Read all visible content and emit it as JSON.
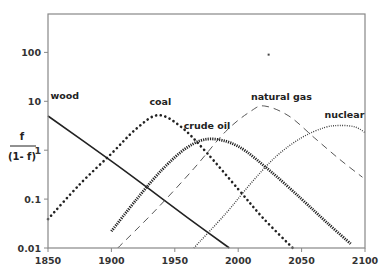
{
  "chart_data": {
    "type": "line",
    "title": "",
    "xlabel": "",
    "ylabel": "f / (1-f)",
    "ylabel_numerator": "f",
    "ylabel_denominator": "(1- f)",
    "yscale": "log",
    "xlim": [
      1850,
      2100
    ],
    "ylim": [
      0.01,
      600
    ],
    "grid": false,
    "legend": "inline labels",
    "x_ticks": [
      1850,
      1900,
      1950,
      2000,
      2050,
      2100
    ],
    "x_tick_labels": [
      "1850",
      "1900",
      "1950",
      "2000",
      "2050",
      "2100"
    ],
    "y_ticks": [
      0.01,
      0.1,
      1,
      10,
      100
    ],
    "y_tick_labels": [
      "0.01",
      "0.1",
      "1",
      "10",
      "100"
    ],
    "series": [
      {
        "name": "wood",
        "style": "solid",
        "label_pos": [
          1852,
          11
        ],
        "points": [
          [
            1850,
            5.0
          ],
          [
            1900,
            0.6
          ],
          [
            1930,
            0.16
          ],
          [
            1960,
            0.042
          ],
          [
            1993,
            0.01
          ]
        ]
      },
      {
        "name": "coal",
        "style": "dotted-large",
        "label_pos": [
          1930,
          8.5
        ],
        "points": [
          [
            1850,
            0.039
          ],
          [
            1875,
            0.2
          ],
          [
            1900,
            0.85
          ],
          [
            1920,
            2.8
          ],
          [
            1937,
            5.2
          ],
          [
            1955,
            3.0
          ],
          [
            1975,
            0.9
          ],
          [
            2000,
            0.16
          ],
          [
            2020,
            0.04
          ],
          [
            2043,
            0.01
          ]
        ]
      },
      {
        "name": "crude oil",
        "style": "dotted-dense",
        "label_pos": [
          1957,
          2.7
        ],
        "points": [
          [
            1900,
            0.022
          ],
          [
            1920,
            0.1
          ],
          [
            1940,
            0.4
          ],
          [
            1960,
            1.15
          ],
          [
            1978,
            1.7
          ],
          [
            2000,
            1.2
          ],
          [
            2025,
            0.38
          ],
          [
            2050,
            0.1
          ],
          [
            2070,
            0.033
          ],
          [
            2089,
            0.012
          ]
        ]
      },
      {
        "name": "natural gas",
        "style": "dashed",
        "label_pos": [
          2010,
          10.5
        ],
        "points": [
          [
            1905,
            0.01
          ],
          [
            1935,
            0.06
          ],
          [
            1965,
            0.42
          ],
          [
            1990,
            2.4
          ],
          [
            2010,
            6.3
          ],
          [
            2021,
            8.0
          ],
          [
            2040,
            5.0
          ],
          [
            2060,
            1.8
          ],
          [
            2080,
            0.65
          ],
          [
            2098,
            0.28
          ]
        ]
      },
      {
        "name": "nuclear",
        "style": "dotted-fine",
        "label_pos": [
          2068,
          4.6
        ],
        "points": [
          [
            1965,
            0.01
          ],
          [
            1990,
            0.05
          ],
          [
            2010,
            0.21
          ],
          [
            2030,
            0.75
          ],
          [
            2050,
            1.8
          ],
          [
            2068,
            2.9
          ],
          [
            2080,
            3.2
          ],
          [
            2092,
            3.0
          ],
          [
            2100,
            2.3
          ]
        ]
      }
    ],
    "annotations": [
      {
        "type": "stray-dot",
        "x": 2024,
        "y": 90
      }
    ]
  },
  "labels": {
    "y_numerator": "f",
    "y_denominator": "(1- f)"
  }
}
